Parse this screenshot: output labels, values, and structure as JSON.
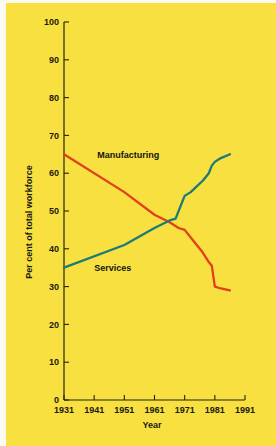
{
  "figure": {
    "background_color": "#f7e03f",
    "page_color": "#fbfbf2",
    "axis_color": "#23231a"
  },
  "chart_data": {
    "type": "line",
    "title": "",
    "xlabel": "Year",
    "ylabel": "Per cent of total workforce",
    "xlim": [
      1931,
      1991
    ],
    "ylim": [
      0,
      100
    ],
    "grid": false,
    "legend": "inline-annotations",
    "x_ticks": [
      1931,
      1941,
      1951,
      1961,
      1971,
      1981,
      1991
    ],
    "y_ticks": [
      0,
      10,
      20,
      30,
      40,
      50,
      60,
      70,
      80,
      90,
      100
    ],
    "series": [
      {
        "name": "Manufacturing",
        "color": "#e0401a",
        "label_x": 1942,
        "label_y": 64,
        "x": [
          1931,
          1951,
          1961,
          1966,
          1969,
          1971,
          1974,
          1977,
          1979,
          1980,
          1981,
          1983,
          1986
        ],
        "values": [
          65,
          55,
          49,
          47,
          45.5,
          45,
          42,
          39,
          36.5,
          35.5,
          30,
          29.5,
          29
        ]
      },
      {
        "name": "Services",
        "color": "#1d7a78",
        "label_x": 1941,
        "label_y": 34,
        "x": [
          1931,
          1951,
          1961,
          1966,
          1968,
          1970,
          1971,
          1973,
          1975,
          1977,
          1979,
          1980,
          1981,
          1983,
          1986
        ],
        "values": [
          35,
          41,
          45.5,
          47.5,
          48,
          52,
          54,
          55,
          56.5,
          58,
          60,
          62,
          63,
          64,
          65
        ]
      }
    ],
    "crossover": {
      "year": 1967,
      "value": 46.5
    }
  },
  "labels": {
    "x_axis_title": "Year",
    "y_axis_title": "Per cent of total workforce",
    "manufacturing": "Manufacturing",
    "services": "Services"
  }
}
